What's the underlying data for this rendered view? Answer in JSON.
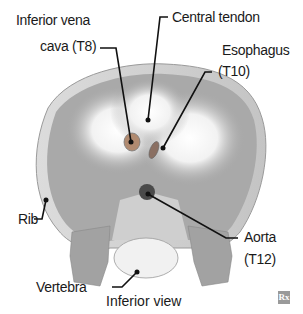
{
  "figure": {
    "view_caption": "Inferior view",
    "logo": "Rx",
    "labels": {
      "ivc_line1": "Inferior vena",
      "ivc_line2": "cava (T8)",
      "central_tendon": "Central tendon",
      "esophagus_line1": "Esophagus",
      "esophagus_line2": "(T10)",
      "rib": "Rib",
      "aorta_line1": "Aorta",
      "aorta_line2": "(T12)",
      "vertebra": "Vertebra"
    }
  },
  "colors": {
    "muscle": "#a9a9a9",
    "tendon": "#f4f4f4",
    "leader": "#111111"
  }
}
